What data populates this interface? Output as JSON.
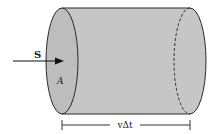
{
  "diagram": {
    "vector_label": "S",
    "area_label": "A",
    "length_label": "vΔt",
    "fill_color": "#c4c4c4",
    "stroke_color": "#2a2a2a"
  }
}
